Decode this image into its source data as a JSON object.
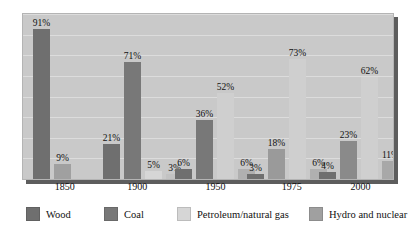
{
  "chart_data": {
    "type": "bar",
    "title": "",
    "subtitle": "",
    "xlabel": "",
    "ylabel": "",
    "ylim": [
      0,
      100
    ],
    "grid": true,
    "grid_values": [
      0,
      12.5,
      25,
      37.5,
      50,
      62.5,
      75,
      87.5,
      100
    ],
    "legend_position": "bottom",
    "categories": [
      "1850",
      "1900",
      "1950",
      "1975",
      "2000"
    ],
    "series": [
      {
        "name": "Wood",
        "color": "#6f6f6f",
        "values": [
          91,
          21,
          6,
          3,
          4
        ]
      },
      {
        "name": "Coal",
        "color": "#787878",
        "values": [
          9,
          71,
          36,
          18,
          23
        ]
      },
      {
        "name": "Petroleum/natural gas",
        "color": "#d6d6d6",
        "values": [
          null,
          5,
          52,
          73,
          62
        ]
      },
      {
        "name": "Hydro and nuclear",
        "color": "#a0a0a0",
        "values": [
          null,
          3,
          6,
          6,
          11
        ]
      }
    ],
    "bars": [
      {
        "group": "1850",
        "series": "Wood",
        "value": 91,
        "label": "91%",
        "color": "#6f6f6f"
      },
      {
        "group": "1850",
        "series": "Coal",
        "value": 9,
        "label": "9%",
        "color": "#a0a0a0"
      },
      {
        "group": "1900",
        "series": "Wood",
        "value": 21,
        "label": "21%",
        "color": "#6f6f6f"
      },
      {
        "group": "1900",
        "series": "Coal",
        "value": 71,
        "label": "71%",
        "color": "#787878"
      },
      {
        "group": "1900",
        "series": "Petroleum/natural gas",
        "value": 5,
        "label": "5%",
        "color": "#d6d6d6"
      },
      {
        "group": "1900",
        "series": "Hydro and nuclear",
        "value": 3,
        "label": "3%",
        "color": "#c2c2c2"
      },
      {
        "group": "1950",
        "series": "Wood",
        "value": 6,
        "label": "6%",
        "color": "#6f6f6f"
      },
      {
        "group": "1950",
        "series": "Coal",
        "value": 36,
        "label": "36%",
        "color": "#787878"
      },
      {
        "group": "1950",
        "series": "Petroleum/natural gas",
        "value": 52,
        "label": "52%",
        "color": "#cfcfcf"
      },
      {
        "group": "1950",
        "series": "Hydro and nuclear",
        "value": 6,
        "label": "6%",
        "color": "#b0b0b0"
      },
      {
        "group": "1975",
        "series": "Wood",
        "value": 3,
        "label": "3%",
        "color": "#6f6f6f"
      },
      {
        "group": "1975",
        "series": "Coal",
        "value": 18,
        "label": "18%",
        "color": "#9a9a9a"
      },
      {
        "group": "1975",
        "series": "Petroleum/natural gas",
        "value": 73,
        "label": "73%",
        "color": "#cfcfcf"
      },
      {
        "group": "1975",
        "series": "Hydro and nuclear",
        "value": 6,
        "label": "6%",
        "color": "#b0b0b0"
      },
      {
        "group": "2000",
        "series": "Wood",
        "value": 4,
        "label": "4%",
        "color": "#6f6f6f"
      },
      {
        "group": "2000",
        "series": "Coal",
        "value": 23,
        "label": "23%",
        "color": "#8a8a8a"
      },
      {
        "group": "2000",
        "series": "Petroleum/natural gas",
        "value": 62,
        "label": "62%",
        "color": "#cfcfcf"
      },
      {
        "group": "2000",
        "series": "Hydro and nuclear",
        "value": 11,
        "label": "11%",
        "color": "#a8a8a8"
      }
    ]
  },
  "axis": {
    "x_ticks": [
      {
        "label": "1850",
        "x_pct": 11.5
      },
      {
        "label": "1900",
        "x_pct": 31.0
      },
      {
        "label": "1950",
        "x_pct": 52.0
      },
      {
        "label": "1975",
        "x_pct": 72.5
      },
      {
        "label": "2000",
        "x_pct": 91.0
      }
    ]
  },
  "legend": {
    "items": [
      {
        "label": "Wood",
        "color": "#6f6f6f",
        "left": 4
      },
      {
        "label": "Coal",
        "color": "#787878",
        "left": 82
      },
      {
        "label": "Petroleum/natural gas",
        "color": "#d6d6d6",
        "left": 155
      },
      {
        "label": "Hydro and nuclear",
        "color": "#a0a0a0",
        "left": 287
      }
    ]
  },
  "colors": {
    "plot_background": "#c9c9c9",
    "page_background": "#ffffff",
    "gridline": "#dcdcdc",
    "frame_shadow": "#5d5d5d",
    "text": "#111111"
  }
}
